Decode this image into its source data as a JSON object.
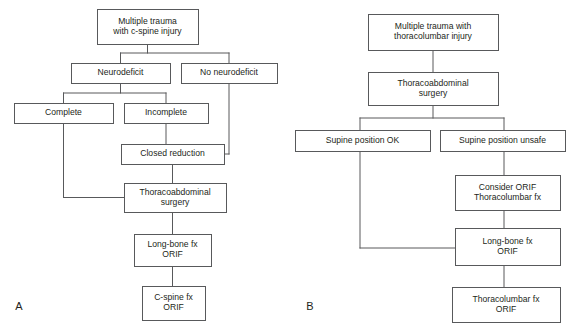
{
  "figure": {
    "background_color": "#ffffff",
    "line_color": "#58595b",
    "text_color": "#231f20",
    "type": "clinical-decision-flowchart"
  },
  "panels": [
    {
      "id": "A",
      "label": "A",
      "label_x": 19,
      "label_y": 310,
      "nodes": [
        {
          "id": "a-multiple-trauma-cspine",
          "name": "multiple-trauma-c-spine-injury",
          "lines": [
            "Multiple trauma",
            "with c-spine injury"
          ],
          "x": 97,
          "y": 9,
          "w": 101,
          "h": 35
        },
        {
          "id": "a-neurodeficit",
          "name": "neurodeficit",
          "lines": [
            "Neurodeficit"
          ],
          "x": 71,
          "y": 63,
          "w": 99,
          "h": 20
        },
        {
          "id": "a-no-neurodeficit",
          "name": "no-neurodeficit",
          "lines": [
            "No neurodeficit"
          ],
          "x": 181,
          "y": 63,
          "w": 96,
          "h": 20
        },
        {
          "id": "a-complete",
          "name": "complete",
          "lines": [
            "Complete"
          ],
          "x": 14,
          "y": 103,
          "w": 99,
          "h": 20
        },
        {
          "id": "a-incomplete",
          "name": "incomplete",
          "lines": [
            "Incomplete"
          ],
          "x": 124,
          "y": 103,
          "w": 84,
          "h": 20
        },
        {
          "id": "a-closed-reduction",
          "name": "closed-reduction",
          "lines": [
            "Closed reduction"
          ],
          "x": 121,
          "y": 144,
          "w": 103,
          "h": 20
        },
        {
          "id": "a-thoracoabdominal-surgery",
          "name": "thoracoabdominal-surgery",
          "lines": [
            "Thoracoabdominal",
            "surgery"
          ],
          "x": 124,
          "y": 183,
          "w": 102,
          "h": 29
        },
        {
          "id": "a-long-bone-orif",
          "name": "long-bone-fx-orif",
          "lines": [
            "Long-bone fx",
            "ORIF"
          ],
          "x": 134,
          "y": 234,
          "w": 77,
          "h": 32
        },
        {
          "id": "a-cspine-orif",
          "name": "c-spine-fx-orif",
          "lines": [
            "C-spine fx",
            "ORIF"
          ],
          "x": 142,
          "y": 286,
          "w": 63,
          "h": 34
        }
      ],
      "connectors": [
        {
          "name": "conn-trauma-to-split",
          "points": "147.5,44 147.5,53"
        },
        {
          "name": "conn-split-horizontal",
          "points": "120.5,53 229,53"
        },
        {
          "name": "conn-split-to-neurodeficit",
          "points": "120.5,53 120.5,63"
        },
        {
          "name": "conn-split-to-no-neurodeficit",
          "points": "229,53 229,63"
        },
        {
          "name": "conn-neurodeficit-to-split2",
          "points": "120.5,83 120.5,93"
        },
        {
          "name": "conn-split2-horizontal",
          "points": "63.5,93 166,93"
        },
        {
          "name": "conn-split2-to-complete",
          "points": "63.5,93 63.5,103"
        },
        {
          "name": "conn-split2-to-incomplete",
          "points": "166,93 166,103"
        },
        {
          "name": "conn-incomplete-to-closed-reduction",
          "points": "166,123 166,144"
        },
        {
          "name": "conn-no-neurodeficit-down",
          "points": "229,83 229,154"
        },
        {
          "name": "conn-no-neurodeficit-into-closed-reduction",
          "points": "229,154 224,154"
        },
        {
          "name": "conn-closed-reduction-to-thoraco",
          "points": "172.5,164 172.5,183"
        },
        {
          "name": "conn-complete-down",
          "points": "63.5,123 63.5,197.5"
        },
        {
          "name": "conn-complete-into-thoraco",
          "points": "63.5,197.5 124,197.5"
        },
        {
          "name": "conn-thoraco-to-longbone",
          "points": "172.5,212 172.5,234"
        },
        {
          "name": "conn-longbone-to-cspine",
          "points": "172.5,266 172.5,286"
        }
      ]
    },
    {
      "id": "B",
      "label": "B",
      "label_x": 310,
      "label_y": 310,
      "nodes": [
        {
          "id": "b-multiple-trauma-thoracolumbar",
          "name": "multiple-trauma-thoracolumbar-injury",
          "lines": [
            "Multiple trauma with",
            "thoracolumbar injury"
          ],
          "x": 368,
          "y": 14,
          "w": 130,
          "h": 36
        },
        {
          "id": "b-thoracoabdominal-surgery",
          "name": "thoracoabdominal-surgery",
          "lines": [
            "Thoracoabdominal",
            "surgery"
          ],
          "x": 368,
          "y": 72,
          "w": 130,
          "h": 33
        },
        {
          "id": "b-supine-ok",
          "name": "supine-position-ok",
          "lines": [
            "Supine position OK"
          ],
          "x": 295,
          "y": 130,
          "w": 135,
          "h": 21
        },
        {
          "id": "b-supine-unsafe",
          "name": "supine-position-unsafe",
          "lines": [
            "Supine position unsafe"
          ],
          "x": 440,
          "y": 130,
          "w": 125,
          "h": 21
        },
        {
          "id": "b-consider-orif",
          "name": "consider-orif-thoracolumbar-fx",
          "lines": [
            "Consider ORIF",
            "Thoracolumbar fx"
          ],
          "x": 455,
          "y": 175,
          "w": 105,
          "h": 35
        },
        {
          "id": "b-long-bone-orif",
          "name": "long-bone-fx-orif",
          "lines": [
            "Long-bone fx",
            "ORIF"
          ],
          "x": 455,
          "y": 228,
          "w": 105,
          "h": 37
        },
        {
          "id": "b-thoracolumbar-orif",
          "name": "thoracolumbar-fx-orif",
          "lines": [
            "Thoracolumbar fx",
            "ORIF"
          ],
          "x": 452,
          "y": 287,
          "w": 108,
          "h": 35
        }
      ],
      "connectors": [
        {
          "name": "conn-trauma-to-surgery",
          "points": "433,50 433,72"
        },
        {
          "name": "conn-surgery-to-split",
          "points": "433,105 433,118"
        },
        {
          "name": "conn-split-horizontal",
          "points": "360,118 504,118"
        },
        {
          "name": "conn-split-to-supine-ok",
          "points": "360,118 360,130"
        },
        {
          "name": "conn-split-to-supine-unsafe",
          "points": "504,118 504,130"
        },
        {
          "name": "conn-supine-unsafe-to-consider",
          "points": "504,151 504,175"
        },
        {
          "name": "conn-consider-to-longbone",
          "points": "504,210 504,228"
        },
        {
          "name": "conn-supine-ok-down",
          "points": "360,151 360,248"
        },
        {
          "name": "conn-supine-ok-into-longbone",
          "points": "360,248 455,248"
        },
        {
          "name": "conn-longbone-to-thoracolumbar",
          "points": "504,265 504,287"
        }
      ]
    }
  ]
}
